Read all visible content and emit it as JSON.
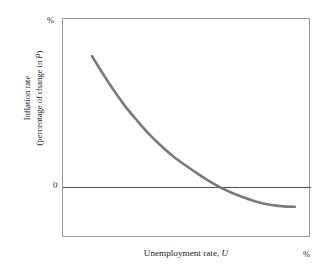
{
  "figure": {
    "y_axis_unit": "%",
    "x_axis_unit": "%",
    "zero_tick": "0",
    "y_title_line1": "Inflation rate",
    "y_title_line2_pre": "(percentage of change in ",
    "y_title_line2_var": "P",
    "y_title_line2_post": ")",
    "x_title_pre": "Unemployment rate, ",
    "x_title_var": "U",
    "curve_color": "#7a7a7a",
    "frame_color": "#9a9a9a",
    "zero_line_color": "#4d4d4d",
    "background_color": "#ffffff"
  },
  "chart_data": {
    "type": "line",
    "title": "",
    "subtitle": "",
    "xlabel": "Unemployment rate, U",
    "ylabel": "Inflation rate (percentage of change in P)",
    "x_unit": "%",
    "y_unit": "%",
    "grid": false,
    "legend": null,
    "xlim": [
      0,
      100
    ],
    "ylim": [
      -30,
      100
    ],
    "yticks": [
      0
    ],
    "ytick_labels": [
      "0"
    ],
    "xticks": [],
    "xtick_labels": [],
    "annotations": [
      {
        "text": "%",
        "position": "y-axis-top"
      },
      {
        "text": "%",
        "position": "x-axis-right"
      },
      {
        "text": "0",
        "position": "y-axis-zero"
      }
    ],
    "series": [
      {
        "name": "Phillips curve",
        "color": "#7a7a7a",
        "linewidth": 2.6,
        "x": [
          11.7,
          15.0,
          18.5,
          22.0,
          26.0,
          30.0,
          34.5,
          39.0,
          44.0,
          49.5,
          55.0,
          61.0,
          67.0,
          73.0,
          78.0,
          82.5,
          86.0,
          89.0,
          91.0,
          93.5
        ],
        "y": [
          78.0,
          70.0,
          62.0,
          54.5,
          46.5,
          39.5,
          32.0,
          25.5,
          19.0,
          13.0,
          7.5,
          2.0,
          -2.5,
          -6.0,
          -8.5,
          -10.0,
          -10.8,
          -11.2,
          -11.4,
          -11.5
        ]
      }
    ]
  }
}
